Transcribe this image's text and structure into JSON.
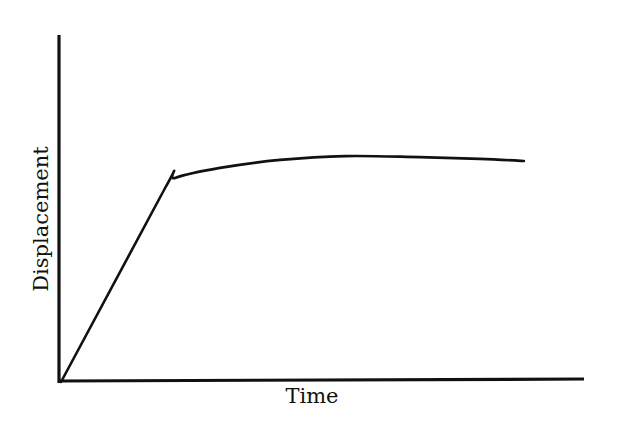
{
  "chart_data": {
    "type": "line",
    "title": "",
    "xlabel": "Time",
    "ylabel": "Displacement",
    "xlim": [
      0,
      100
    ],
    "ylim": [
      0,
      100
    ],
    "grid": false,
    "legend": null,
    "ticks": {
      "x": [],
      "y": []
    },
    "series": [
      {
        "name": "Displacement vs Time",
        "x": [
          0,
          19.9,
          21.8,
          30.4,
          41.9,
          54.3,
          68.6,
          80.1,
          88.5
        ],
        "values": [
          0,
          55.9,
          58.8,
          61.7,
          64.0,
          65.1,
          64.8,
          64.3,
          63.7
        ]
      }
    ]
  },
  "colors": {
    "line": "#111111",
    "axis": "#111111",
    "background": "#ffffff"
  }
}
